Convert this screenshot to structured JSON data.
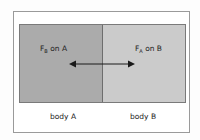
{
  "diagram": {
    "type": "newton-third-law-force-pair",
    "bodies": [
      {
        "id": "A",
        "label": "body A",
        "fill": "#ababab"
      },
      {
        "id": "B",
        "label": "body B",
        "fill": "#cbcbcb"
      }
    ],
    "forces": [
      {
        "symbol": "F",
        "subscript": "B",
        "suffix": " on A",
        "direction": "left"
      },
      {
        "symbol": "F",
        "subscript": "A",
        "suffix": " on B",
        "direction": "right"
      }
    ],
    "colors": {
      "frame": "#9a9a9a",
      "divider": "#6e6e6e",
      "arrow": "#1a1a1a",
      "text": "#222222"
    }
  }
}
